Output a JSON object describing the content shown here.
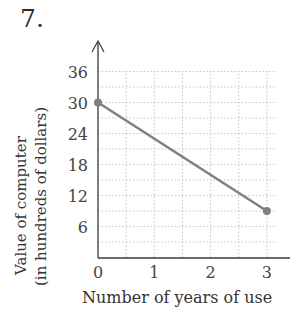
{
  "problem_number": "7.",
  "chart_data": {
    "type": "line",
    "title": "",
    "xlabel": "Number of years of use",
    "ylabel_line1": "Value of computer",
    "ylabel_line2": "(in hundreds of dollars)",
    "x_ticks": [
      "0",
      "1",
      "2",
      "3"
    ],
    "y_ticks": [
      "6",
      "12",
      "18",
      "24",
      "30",
      "36"
    ],
    "xlim": [
      0,
      3.5
    ],
    "ylim": [
      0,
      36
    ],
    "grid": true,
    "grid_style": "dotted",
    "grid_x_step": 0.5,
    "grid_y_step": 3,
    "legend": null,
    "series": [
      {
        "name": "Value of computer",
        "x": [
          0,
          3
        ],
        "y": [
          30,
          9
        ],
        "color": "#808080",
        "markers": "endpoints"
      }
    ]
  },
  "colors": {
    "axis": "#3a3a3a",
    "grid": "#b8b8b8",
    "line": "#808080"
  }
}
